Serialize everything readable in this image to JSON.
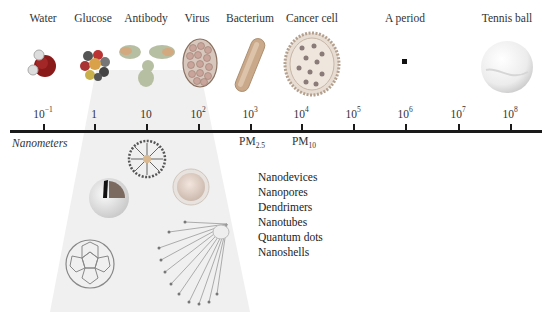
{
  "objects": [
    {
      "label": "Water",
      "size_exponent": -1,
      "icon": "water-molecule-icon"
    },
    {
      "label": "Glucose",
      "size_exponent": 0,
      "icon": "glucose-molecule-icon"
    },
    {
      "label": "Antibody",
      "size_exponent": 1,
      "icon": "antibody-icon"
    },
    {
      "label": "Virus",
      "size_exponent": 2,
      "icon": "virus-icon"
    },
    {
      "label": "Bacterium",
      "size_exponent": 3,
      "icon": "bacterium-icon"
    },
    {
      "label": "Cancer cell",
      "size_exponent": 4,
      "icon": "cancer-cell-icon"
    },
    {
      "label": "A period",
      "size_exponent": 6,
      "icon": "period-dot-icon"
    },
    {
      "label": "Tennis ball",
      "size_exponent": 8,
      "icon": "tennis-ball-icon"
    }
  ],
  "axis": {
    "unit_label": "Nanometers",
    "ticks": [
      {
        "base": "10",
        "exp": "−1"
      },
      {
        "base": "1",
        "exp": ""
      },
      {
        "base": "10",
        "exp": ""
      },
      {
        "base": "10",
        "exp": "2"
      },
      {
        "base": "10",
        "exp": "3"
      },
      {
        "base": "10",
        "exp": "4"
      },
      {
        "base": "10",
        "exp": "5"
      },
      {
        "base": "10",
        "exp": "6"
      },
      {
        "base": "10",
        "exp": "7"
      },
      {
        "base": "10",
        "exp": "8"
      }
    ],
    "markers": [
      {
        "base": "PM",
        "sub": "2.5",
        "at": "10^3"
      },
      {
        "base": "PM",
        "sub": "10",
        "at": "10^4"
      }
    ]
  },
  "nanomaterials": {
    "list": [
      "Nanodevices",
      "Nanopores",
      "Dendrimers",
      "Nanotubes",
      "Quantum dots",
      "Nanoshells"
    ],
    "icons": [
      "dendrimer-icon",
      "nanoshell-icon",
      "quantum-dot-icon",
      "fullerene-icon",
      "nanotube-icon"
    ]
  },
  "colors": {
    "axis": "#1a1a1a",
    "cone": "#efefef",
    "text": "#333333"
  }
}
